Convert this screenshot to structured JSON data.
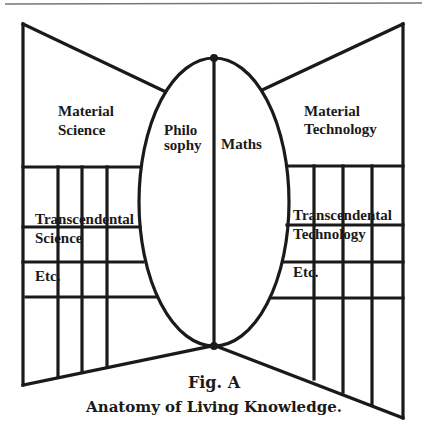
{
  "figure": {
    "caption_number": "Fig. A",
    "caption_title": "Anatomy of Living Knowledge.",
    "center": {
      "left_label_line1": "Philo",
      "left_label_line2": "sophy",
      "right_label": "Maths"
    },
    "left_wing": {
      "top_label_line1": "Material",
      "top_label_line2": "Science",
      "row1_label_line1": "Transcendental",
      "row1_label_line2": "Science",
      "row2_label": "Etc."
    },
    "right_wing": {
      "top_label_line1": "Material",
      "top_label_line2": "Technology",
      "row1_label_line1": "Transcendental",
      "row1_label_line2": "Technology",
      "row2_label": "Etc."
    },
    "colors": {
      "ink": "#1a1a1a",
      "rule": "#777777",
      "background": "#ffffff"
    }
  }
}
